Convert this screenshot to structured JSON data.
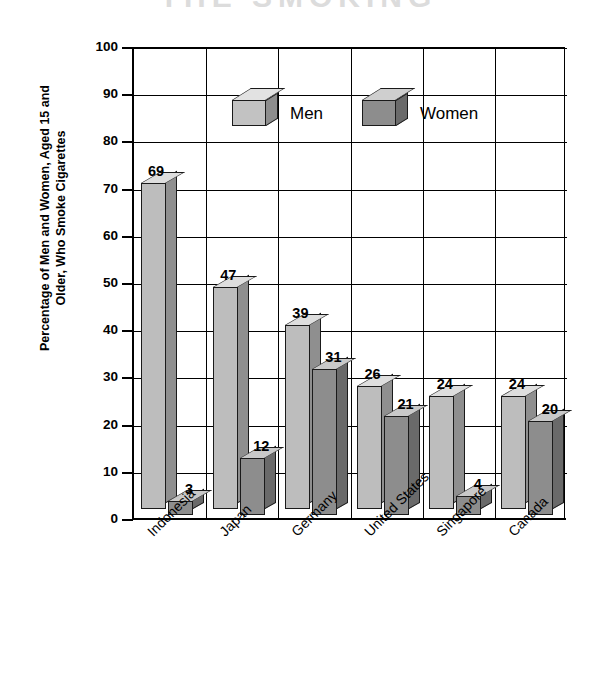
{
  "title_strip": {
    "text": "THE SMOKING"
  },
  "chart_data": {
    "type": "bar",
    "title": "",
    "xlabel": "",
    "ylabel": "Percentage of Men and Women, Aged 15 and Older, Who Smoke Cigarettes",
    "ylabel_lines": [
      "Percentage of Men and Women, Aged 15 and",
      "Older, Who Smoke Cigarettes"
    ],
    "ylim": [
      0,
      100
    ],
    "ytick_values": [
      0,
      10,
      20,
      30,
      40,
      50,
      60,
      70,
      80,
      90,
      100
    ],
    "ytick_labels": [
      "0",
      "10",
      "20",
      "30",
      "40",
      "50",
      "60",
      "70",
      "80",
      "90",
      "100"
    ],
    "grid": true,
    "legend_position": "inside-top-center",
    "categories": [
      "Indonesia",
      "Japan",
      "Germany",
      "United States",
      "Singapore",
      "Canada"
    ],
    "series": [
      {
        "name": "Men",
        "color": "#bdbdbd",
        "values": [
          69,
          47,
          39,
          26,
          24,
          24
        ],
        "labels": [
          "69",
          "47",
          "39",
          "26",
          "24",
          "24"
        ]
      },
      {
        "name": "Women",
        "color": "#8d8d8d",
        "values": [
          3,
          12,
          31,
          21,
          4,
          20
        ],
        "labels": [
          "3",
          "12",
          "31",
          "21",
          "4",
          "20"
        ]
      }
    ]
  },
  "legend": {
    "items": [
      {
        "label": "Men",
        "color": "#bdbdbd"
      },
      {
        "label": "Women",
        "color": "#8d8d8d"
      }
    ]
  }
}
